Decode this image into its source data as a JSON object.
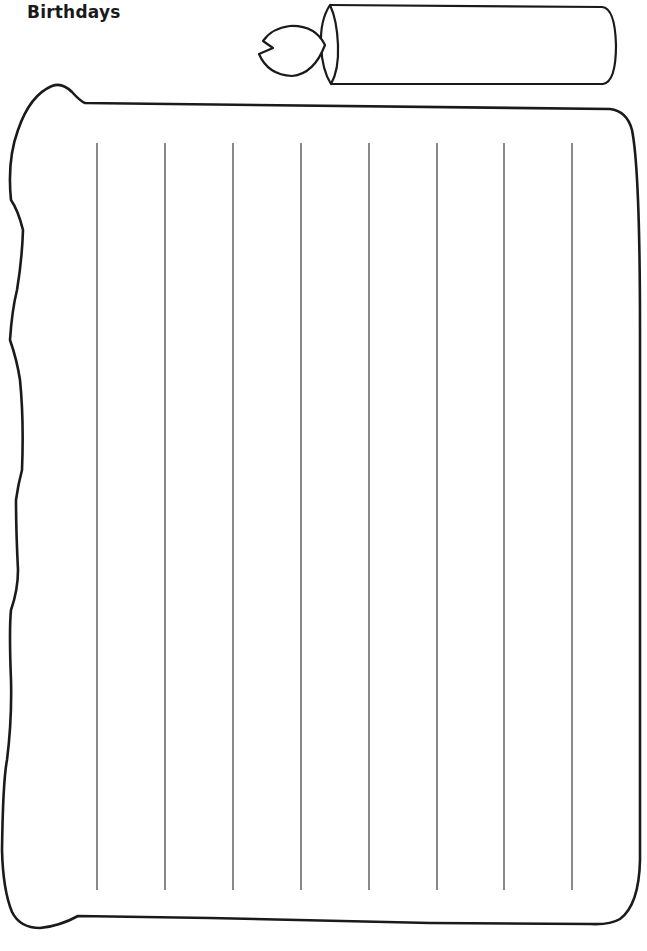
{
  "page": {
    "title": "Birthdays"
  },
  "decoration": {
    "candle": {
      "icon": "candle-icon",
      "flame_icon": "flame-icon"
    },
    "banner": {
      "icon": "scroll-banner-icon"
    }
  },
  "writing_area": {
    "column_count": 9,
    "divider_count": 8,
    "divider_x": [
      97,
      165,
      233,
      301,
      369,
      437,
      504,
      572
    ],
    "divider_top": 143,
    "divider_bottom": 890
  },
  "colors": {
    "ink": "#1a1a1a",
    "divider": "#3a3a3a",
    "paper": "#ffffff"
  }
}
